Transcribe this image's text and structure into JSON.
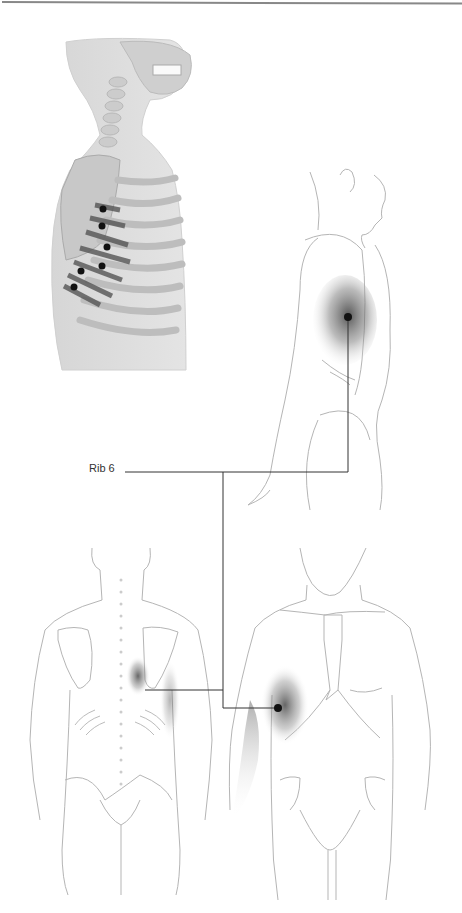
{
  "figure": {
    "labels": {
      "rib_label": "Rib 6"
    },
    "panels": [
      {
        "name": "skeletal-lateral-view",
        "description": "Lateral view of skeleton torso with muscle fibers and trigger point dots"
      },
      {
        "name": "lateral-body-view",
        "description": "Side view outline of body with shaded pain area on lateral chest"
      },
      {
        "name": "posterior-body-view",
        "description": "Back view outline with shaded area near inferior scapula"
      },
      {
        "name": "anterior-body-view",
        "description": "Front view outline with shaded area on lateral chest and inner arm"
      }
    ],
    "trigger_point_count_skeleton": 6,
    "colors": {
      "line": "#333333",
      "outline": "#b5b5b5",
      "dot": "#111111",
      "bone": "#c9c9c9",
      "muscle": "#555555"
    }
  }
}
